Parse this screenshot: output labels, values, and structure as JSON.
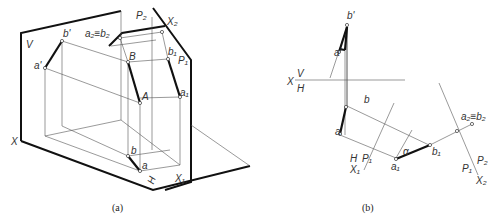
{
  "figure_a": {
    "caption": "(a)",
    "labels": {
      "V": "V",
      "X": "X",
      "H": "H",
      "b_prime": "b'",
      "a_prime": "a'",
      "B": "B",
      "A": "A",
      "b": "b",
      "a": "a",
      "a2b2": "a₂≡b₂",
      "P2": "P₂",
      "X2": "X₂",
      "b1": "b₁",
      "P1": "P₁",
      "a1": "a₁",
      "X1": "X₁"
    }
  },
  "figure_b": {
    "caption": "(b)",
    "labels": {
      "b_prime": "b'",
      "a_prime": "a'",
      "X": "X",
      "V": "V",
      "H": "H",
      "b": "b",
      "a": "a",
      "H2": "H",
      "P1": "P₁",
      "X1": "X₁",
      "a1": "a₁",
      "alpha": "α",
      "b1": "b₁",
      "a2b2": "a₂≡b₂",
      "P1b": "P₁",
      "P2": "P₂",
      "X2": "X₂"
    }
  }
}
